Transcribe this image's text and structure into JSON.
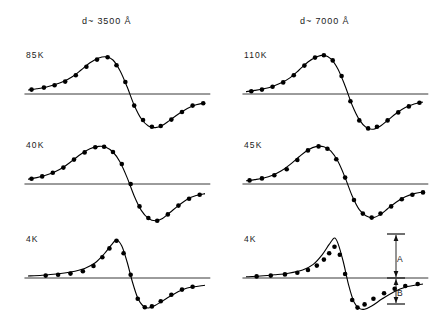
{
  "figure": {
    "columns": [
      {
        "id": "left",
        "header": "d~ 3500 Å"
      },
      {
        "id": "right",
        "header": "d~ 7000 Å"
      }
    ],
    "scalebar": {
      "segment_a_label": "A",
      "segment_b_label": "B"
    }
  },
  "chart_data": {
    "type": "line",
    "title": "",
    "xlabel": "",
    "ylabel": "",
    "grid": false,
    "legend": "none",
    "xlim": [
      0,
      1
    ],
    "ylim": [
      -1,
      1
    ],
    "panels": [
      {
        "id": "left-85K",
        "column": "left",
        "thickness": "d~ 3500 Å",
        "temperature": "85K",
        "curve": [
          [
            0.0,
            0.1
          ],
          [
            0.05,
            0.13
          ],
          [
            0.1,
            0.17
          ],
          [
            0.15,
            0.23
          ],
          [
            0.2,
            0.31
          ],
          [
            0.25,
            0.43
          ],
          [
            0.3,
            0.6
          ],
          [
            0.35,
            0.78
          ],
          [
            0.4,
            0.9
          ],
          [
            0.44,
            0.93
          ],
          [
            0.48,
            0.85
          ],
          [
            0.52,
            0.58
          ],
          [
            0.56,
            0.18
          ],
          [
            0.6,
            -0.28
          ],
          [
            0.64,
            -0.62
          ],
          [
            0.68,
            -0.8
          ],
          [
            0.72,
            -0.84
          ],
          [
            0.76,
            -0.78
          ],
          [
            0.8,
            -0.66
          ],
          [
            0.85,
            -0.5
          ],
          [
            0.9,
            -0.36
          ],
          [
            0.95,
            -0.27
          ],
          [
            1.0,
            -0.22
          ]
        ],
        "points": [
          [
            0.02,
            0.11
          ],
          [
            0.09,
            0.16
          ],
          [
            0.15,
            0.22
          ],
          [
            0.21,
            0.31
          ],
          [
            0.27,
            0.47
          ],
          [
            0.33,
            0.68
          ],
          [
            0.39,
            0.86
          ],
          [
            0.45,
            0.92
          ],
          [
            0.5,
            0.72
          ],
          [
            0.55,
            0.3
          ],
          [
            0.6,
            -0.29
          ],
          [
            0.65,
            -0.65
          ],
          [
            0.7,
            -0.82
          ],
          [
            0.75,
            -0.8
          ],
          [
            0.81,
            -0.64
          ],
          [
            0.87,
            -0.45
          ],
          [
            0.93,
            -0.29
          ],
          [
            0.99,
            -0.23
          ]
        ]
      },
      {
        "id": "left-40K",
        "column": "left",
        "thickness": "d~ 3500 Å",
        "temperature": "40K",
        "curve": [
          [
            0.0,
            0.12
          ],
          [
            0.05,
            0.16
          ],
          [
            0.1,
            0.22
          ],
          [
            0.15,
            0.3
          ],
          [
            0.2,
            0.42
          ],
          [
            0.25,
            0.58
          ],
          [
            0.3,
            0.75
          ],
          [
            0.35,
            0.88
          ],
          [
            0.4,
            0.94
          ],
          [
            0.44,
            0.92
          ],
          [
            0.48,
            0.8
          ],
          [
            0.52,
            0.55
          ],
          [
            0.56,
            0.16
          ],
          [
            0.6,
            -0.3
          ],
          [
            0.64,
            -0.66
          ],
          [
            0.68,
            -0.86
          ],
          [
            0.72,
            -0.92
          ],
          [
            0.76,
            -0.86
          ],
          [
            0.8,
            -0.72
          ],
          [
            0.85,
            -0.54
          ],
          [
            0.9,
            -0.38
          ],
          [
            0.95,
            -0.29
          ],
          [
            1.0,
            -0.24
          ]
        ],
        "points": [
          [
            0.02,
            0.13
          ],
          [
            0.08,
            0.19
          ],
          [
            0.14,
            0.28
          ],
          [
            0.2,
            0.41
          ],
          [
            0.26,
            0.61
          ],
          [
            0.32,
            0.79
          ],
          [
            0.38,
            0.92
          ],
          [
            0.43,
            0.93
          ],
          [
            0.48,
            0.8
          ],
          [
            0.53,
            0.5
          ],
          [
            0.58,
            0.0
          ],
          [
            0.63,
            -0.56
          ],
          [
            0.68,
            -0.85
          ],
          [
            0.73,
            -0.92
          ],
          [
            0.79,
            -0.76
          ],
          [
            0.85,
            -0.54
          ],
          [
            0.91,
            -0.37
          ],
          [
            0.97,
            -0.27
          ]
        ]
      },
      {
        "id": "left-4K",
        "column": "left",
        "thickness": "d~ 3500 Å",
        "temperature": "4K",
        "curve": [
          [
            0.0,
            0.05
          ],
          [
            0.08,
            0.07
          ],
          [
            0.16,
            0.1
          ],
          [
            0.24,
            0.15
          ],
          [
            0.32,
            0.24
          ],
          [
            0.38,
            0.38
          ],
          [
            0.43,
            0.6
          ],
          [
            0.47,
            0.82
          ],
          [
            0.5,
            0.95
          ],
          [
            0.53,
            0.8
          ],
          [
            0.56,
            0.4
          ],
          [
            0.59,
            -0.1
          ],
          [
            0.62,
            -0.5
          ],
          [
            0.65,
            -0.7
          ],
          [
            0.68,
            -0.75
          ],
          [
            0.72,
            -0.68
          ],
          [
            0.78,
            -0.52
          ],
          [
            0.84,
            -0.36
          ],
          [
            0.9,
            -0.25
          ],
          [
            1.0,
            -0.18
          ]
        ],
        "points": [
          [
            0.1,
            0.06
          ],
          [
            0.17,
            0.08
          ],
          [
            0.24,
            0.11
          ],
          [
            0.31,
            0.17
          ],
          [
            0.37,
            0.3
          ],
          [
            0.42,
            0.52
          ],
          [
            0.46,
            0.74
          ],
          [
            0.5,
            0.93
          ],
          [
            0.54,
            0.62
          ],
          [
            0.58,
            0.08
          ],
          [
            0.62,
            -0.52
          ],
          [
            0.66,
            -0.73
          ],
          [
            0.7,
            -0.71
          ],
          [
            0.75,
            -0.58
          ],
          [
            0.81,
            -0.42
          ],
          [
            0.87,
            -0.29
          ],
          [
            0.93,
            -0.22
          ]
        ]
      },
      {
        "id": "right-110K",
        "column": "right",
        "thickness": "d~ 7000 Å",
        "temperature": "110K",
        "curve": [
          [
            0.0,
            0.06
          ],
          [
            0.05,
            0.09
          ],
          [
            0.1,
            0.13
          ],
          [
            0.15,
            0.19
          ],
          [
            0.2,
            0.28
          ],
          [
            0.25,
            0.41
          ],
          [
            0.3,
            0.6
          ],
          [
            0.35,
            0.8
          ],
          [
            0.4,
            0.93
          ],
          [
            0.44,
            0.97
          ],
          [
            0.48,
            0.88
          ],
          [
            0.52,
            0.62
          ],
          [
            0.56,
            0.2
          ],
          [
            0.6,
            -0.28
          ],
          [
            0.64,
            -0.64
          ],
          [
            0.68,
            -0.84
          ],
          [
            0.72,
            -0.88
          ],
          [
            0.76,
            -0.8
          ],
          [
            0.8,
            -0.66
          ],
          [
            0.85,
            -0.48
          ],
          [
            0.9,
            -0.34
          ],
          [
            0.95,
            -0.25
          ],
          [
            1.0,
            -0.2
          ]
        ],
        "points": [
          [
            0.03,
            0.07
          ],
          [
            0.09,
            0.11
          ],
          [
            0.15,
            0.18
          ],
          [
            0.21,
            0.29
          ],
          [
            0.27,
            0.47
          ],
          [
            0.33,
            0.71
          ],
          [
            0.39,
            0.91
          ],
          [
            0.44,
            0.97
          ],
          [
            0.49,
            0.84
          ],
          [
            0.54,
            0.45
          ],
          [
            0.59,
            -0.18
          ],
          [
            0.64,
            -0.66
          ],
          [
            0.69,
            -0.86
          ],
          [
            0.74,
            -0.82
          ],
          [
            0.8,
            -0.66
          ],
          [
            0.86,
            -0.46
          ],
          [
            0.92,
            -0.31
          ],
          [
            0.98,
            -0.22
          ]
        ]
      },
      {
        "id": "right-45K",
        "column": "right",
        "thickness": "d~ 7000 Å",
        "temperature": "45K",
        "curve": [
          [
            0.0,
            0.08
          ],
          [
            0.05,
            0.11
          ],
          [
            0.1,
            0.15
          ],
          [
            0.15,
            0.22
          ],
          [
            0.2,
            0.33
          ],
          [
            0.25,
            0.49
          ],
          [
            0.3,
            0.68
          ],
          [
            0.35,
            0.85
          ],
          [
            0.4,
            0.94
          ],
          [
            0.44,
            0.93
          ],
          [
            0.48,
            0.82
          ],
          [
            0.52,
            0.56
          ],
          [
            0.56,
            0.16
          ],
          [
            0.6,
            -0.3
          ],
          [
            0.64,
            -0.64
          ],
          [
            0.68,
            -0.8
          ],
          [
            0.72,
            -0.84
          ],
          [
            0.76,
            -0.76
          ],
          [
            0.8,
            -0.62
          ],
          [
            0.85,
            -0.45
          ],
          [
            0.9,
            -0.32
          ],
          [
            0.95,
            -0.24
          ],
          [
            1.0,
            -0.2
          ]
        ],
        "points": [
          [
            0.02,
            0.09
          ],
          [
            0.09,
            0.14
          ],
          [
            0.16,
            0.22
          ],
          [
            0.23,
            0.37
          ],
          [
            0.29,
            0.6
          ],
          [
            0.35,
            0.84
          ],
          [
            0.41,
            0.94
          ],
          [
            0.46,
            0.88
          ],
          [
            0.51,
            0.62
          ],
          [
            0.56,
            0.16
          ],
          [
            0.61,
            -0.4
          ],
          [
            0.66,
            -0.74
          ],
          [
            0.71,
            -0.84
          ],
          [
            0.76,
            -0.74
          ],
          [
            0.82,
            -0.56
          ],
          [
            0.88,
            -0.38
          ],
          [
            0.94,
            -0.27
          ],
          [
            1.0,
            -0.21
          ]
        ]
      },
      {
        "id": "right-4K",
        "column": "right",
        "thickness": "d~ 7000 Å",
        "temperature": "4K",
        "curve": [
          [
            0.0,
            0.03
          ],
          [
            0.08,
            0.05
          ],
          [
            0.16,
            0.08
          ],
          [
            0.24,
            0.12
          ],
          [
            0.32,
            0.2
          ],
          [
            0.38,
            0.34
          ],
          [
            0.43,
            0.58
          ],
          [
            0.47,
            0.84
          ],
          [
            0.5,
            1.0
          ],
          [
            0.52,
            0.86
          ],
          [
            0.55,
            0.4
          ],
          [
            0.58,
            -0.18
          ],
          [
            0.61,
            -0.6
          ],
          [
            0.64,
            -0.76
          ],
          [
            0.67,
            -0.78
          ],
          [
            0.71,
            -0.7
          ],
          [
            0.77,
            -0.52
          ],
          [
            0.83,
            -0.36
          ],
          [
            0.9,
            -0.23
          ],
          [
            1.0,
            -0.15
          ]
        ],
        "points": [
          [
            0.06,
            0.04
          ],
          [
            0.14,
            0.06
          ],
          [
            0.22,
            0.09
          ],
          [
            0.29,
            0.13
          ],
          [
            0.35,
            0.2
          ],
          [
            0.4,
            0.31
          ],
          [
            0.44,
            0.46
          ],
          [
            0.47,
            0.62
          ],
          [
            0.5,
            0.78
          ],
          [
            0.53,
            0.58
          ],
          [
            0.56,
            0.1
          ],
          [
            0.6,
            -0.55
          ],
          [
            0.63,
            -0.74
          ],
          [
            0.67,
            -0.66
          ],
          [
            0.72,
            -0.52
          ],
          [
            0.78,
            -0.38
          ],
          [
            0.84,
            -0.27
          ],
          [
            0.9,
            -0.2
          ],
          [
            0.97,
            -0.15
          ]
        ]
      }
    ]
  }
}
